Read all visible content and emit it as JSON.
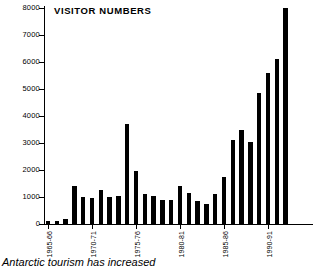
{
  "chart_data": {
    "type": "bar",
    "title": "VISITOR NUMBERS",
    "caption": "Antarctic tourism has increased",
    "xlabel": "",
    "ylabel": "",
    "ylim": [
      0,
      8000
    ],
    "yticks": [
      0,
      1000,
      2000,
      3000,
      4000,
      5000,
      6000,
      7000,
      8000
    ],
    "ytick_labels": [
      "0",
      "1000",
      "2000",
      "3000",
      "4000",
      "5000",
      "6000",
      "7000",
      "8000"
    ],
    "grid": false,
    "legend": "none",
    "xtick_labels": [
      "1965-66",
      "1970-71",
      "1975-76",
      "1980-81",
      "1985-86",
      "1990-91"
    ],
    "xtick_categories": [
      "1965-66",
      "1970-71",
      "1975-76",
      "1980-81",
      "1985-86",
      "1990-91"
    ],
    "bar_color": "#000000",
    "categories": [
      "1965-66",
      "1966-67",
      "1967-68",
      "1968-69",
      "1969-70",
      "1970-71",
      "1971-72",
      "1972-73",
      "1973-74",
      "1974-75",
      "1975-76",
      "1976-77",
      "1977-78",
      "1978-79",
      "1979-80",
      "1980-81",
      "1981-82",
      "1982-83",
      "1983-84",
      "1984-85",
      "1985-86",
      "1986-87",
      "1987-88",
      "1988-89",
      "1989-90",
      "1990-91",
      "1991-92",
      "1992-93",
      "1993-94",
      "1994-95"
    ],
    "values": [
      100,
      120,
      180,
      1400,
      1000,
      950,
      1250,
      1000,
      1050,
      3700,
      1950,
      1100,
      1050,
      900,
      900,
      1400,
      1150,
      850,
      750,
      1100,
      1750,
      3100,
      3500,
      3050,
      4850,
      5600,
      6100,
      8000,
      0,
      0
    ],
    "values_plotted": [
      100,
      120,
      180,
      1400,
      1000,
      950,
      1250,
      1000,
      1050,
      3700,
      1950,
      1100,
      1050,
      900,
      900,
      1400,
      1150,
      850,
      750,
      1100,
      1750,
      3100,
      3500,
      3050,
      4850,
      5600,
      6100,
      8000
    ]
  }
}
